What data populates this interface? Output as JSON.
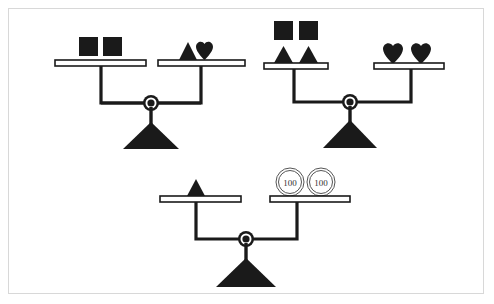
{
  "figure": {
    "background_color": "#ffffff",
    "frame_color": "#d8d8d8",
    "ink_color": "#1a1a1a",
    "coin_outline_color": "#555555"
  },
  "scales": [
    {
      "id": "scale-1",
      "state": "balanced",
      "left_pan": {
        "items": [
          {
            "shape": "square",
            "label": "square",
            "count": 1
          },
          {
            "shape": "square",
            "label": "square",
            "count": 1
          }
        ]
      },
      "right_pan": {
        "items": [
          {
            "shape": "triangle",
            "label": "triangle",
            "count": 1
          },
          {
            "shape": "heart",
            "label": "heart",
            "count": 1
          }
        ]
      }
    },
    {
      "id": "scale-2",
      "state": "balanced",
      "left_pan": {
        "items": [
          {
            "shape": "square",
            "label": "square",
            "count": 1
          },
          {
            "shape": "square",
            "label": "square",
            "count": 1
          },
          {
            "shape": "triangle",
            "label": "triangle",
            "count": 1
          },
          {
            "shape": "triangle",
            "label": "triangle",
            "count": 1
          }
        ]
      },
      "right_pan": {
        "items": [
          {
            "shape": "heart",
            "label": "heart",
            "count": 1
          },
          {
            "shape": "heart",
            "label": "heart",
            "count": 1
          }
        ]
      }
    },
    {
      "id": "scale-3",
      "state": "balanced",
      "left_pan": {
        "items": [
          {
            "shape": "triangle",
            "label": "triangle",
            "count": 1
          }
        ]
      },
      "right_pan": {
        "items": [
          {
            "shape": "coin",
            "label": "100",
            "value": "100",
            "count": 1
          },
          {
            "shape": "coin",
            "label": "100",
            "value": "100",
            "count": 1
          }
        ]
      }
    }
  ],
  "coin_labels": {
    "first": "100",
    "second": "100"
  }
}
